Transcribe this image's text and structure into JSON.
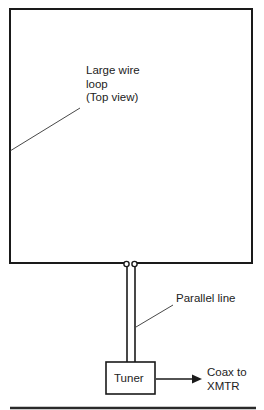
{
  "diagram": {
    "loop": {
      "label_lines": [
        "Large wire",
        "loop",
        "(Top view)"
      ]
    },
    "feedline": {
      "label": "Parallel line"
    },
    "tuner": {
      "label": "Tuner"
    },
    "output": {
      "label_lines": [
        "Coax to",
        "XMTR"
      ]
    },
    "colors": {
      "line": "#1a1a1a",
      "background": "#ffffff"
    }
  }
}
